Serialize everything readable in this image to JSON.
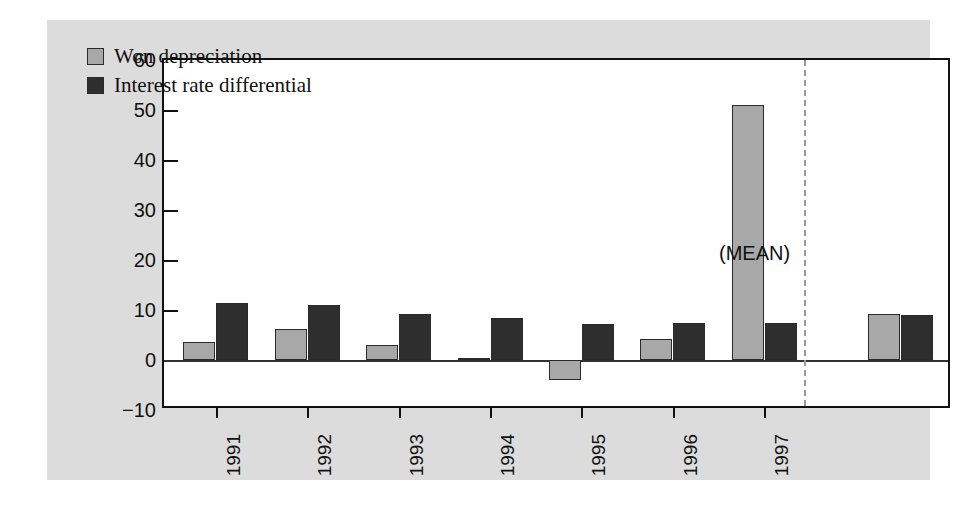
{
  "chart_data": {
    "type": "bar",
    "title": "",
    "subtitle": "",
    "xlabel": "",
    "ylabel": "",
    "categories": [
      "1991",
      "1992",
      "1993",
      "1994",
      "1995",
      "1996",
      "1997",
      "(MEAN)"
    ],
    "series": [
      {
        "name": "Won depreciation",
        "color": "#a8a8a8",
        "values": [
          3.6,
          6.2,
          3.0,
          0.5,
          -4.0,
          4.2,
          51.0,
          9.3
        ]
      },
      {
        "name": "Interest rate differential",
        "color": "#2e2e2e",
        "values": [
          11.5,
          11.0,
          9.2,
          8.5,
          7.2,
          7.5,
          7.5,
          9.0
        ]
      }
    ],
    "ylim": [
      -10,
      60
    ],
    "yticks": [
      60,
      50,
      40,
      30,
      20,
      10,
      0,
      -10
    ],
    "ytick_labels": [
      "60",
      "50",
      "40",
      "30",
      "20",
      "10",
      "0",
      "−10"
    ],
    "xtick_labels": [
      "1991",
      "1992",
      "1993",
      "1994",
      "1995",
      "1996",
      "1997"
    ],
    "grid": false,
    "legend_position": "top-left",
    "annotations": [
      {
        "text": "(MEAN)",
        "note": "label above the mean group"
      }
    ],
    "separator": {
      "style": "dashed",
      "after_category": "1997",
      "color": "#9a9a9a"
    }
  },
  "legend": {
    "items": [
      {
        "label": "Won depreciation"
      },
      {
        "label": "Interest rate differential"
      }
    ]
  },
  "annotation": {
    "mean_label": "(MEAN)"
  },
  "colors": {
    "series_0": "#a8a8a8",
    "series_1": "#2e2e2e",
    "figure_background": "#dcdcdc",
    "plot_background": "#ffffff",
    "axis": "#111111",
    "separator": "#9a9a9a"
  }
}
